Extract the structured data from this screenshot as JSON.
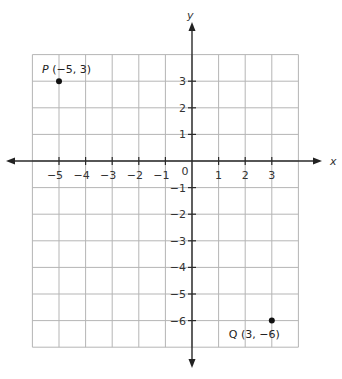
{
  "chart_data": {
    "type": "scatter",
    "title": "",
    "xlabel": "x",
    "ylabel": "y",
    "xlim": [
      -6,
      4
    ],
    "ylim": [
      -7,
      4
    ],
    "grid": true,
    "x_ticks": [
      -5,
      -4,
      -3,
      -2,
      -1,
      1,
      2,
      3
    ],
    "y_ticks": [
      3,
      2,
      1,
      -1,
      -2,
      -3,
      -4,
      -5,
      -6
    ],
    "origin_label": "0",
    "points": [
      {
        "name": "P",
        "x": -5,
        "y": 3,
        "label": "(−5, 3)"
      },
      {
        "name": "Q",
        "x": 3,
        "y": -6,
        "label": "(3, −6)"
      }
    ]
  }
}
